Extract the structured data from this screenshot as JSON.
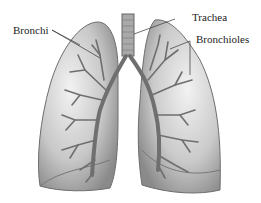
{
  "diagram": {
    "labels": {
      "bronchi": "Bronchi",
      "trachea": "Trachea",
      "bronchioles": "Bronchioles"
    },
    "colors": {
      "background": "#ffffff",
      "lung_fill": "#c9c9c9",
      "lung_edge": "#6e6e6e",
      "airway": "#6f6f6f",
      "text": "#222222"
    }
  }
}
